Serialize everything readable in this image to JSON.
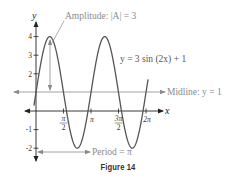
{
  "chart_data": {
    "type": "line",
    "title": "",
    "caption": "Figure 14",
    "function": "y = 3 sin (2x) + 1",
    "xlabel": "x",
    "ylabel": "y",
    "x_ticks": [
      {
        "value": 1.5708,
        "label_num": "π",
        "label_den": "2"
      },
      {
        "value": 3.1416,
        "label": "π"
      },
      {
        "value": 4.7124,
        "label_num": "3π",
        "label_den": "2"
      },
      {
        "value": 6.2832,
        "label": "2π"
      }
    ],
    "y_ticks": [
      {
        "value": 4,
        "label": "4"
      },
      {
        "value": 3,
        "label": "3"
      },
      {
        "value": 2,
        "label": "2"
      },
      {
        "value": -1,
        "label": "-1"
      },
      {
        "value": -2,
        "label": "-2"
      }
    ],
    "xlim": [
      -0.4,
      6.6
    ],
    "ylim": [
      -2.5,
      4.8
    ],
    "series": [
      {
        "name": "y = 3 sin (2x) + 1",
        "amplitude": 3,
        "frequency": 2,
        "vertical_shift": 1,
        "x_start": -0.12,
        "x_end": 6.4
      }
    ],
    "annotations": {
      "amplitude": "Amplitude: |A| = 3",
      "midline": "Midline: y = 1",
      "period": "Period = π",
      "equation": "y = 3 sin (2x) + 1"
    },
    "grid": false,
    "colors": {
      "curve": "#555555",
      "axis": "#222222",
      "annotation": "#8a8a8a"
    }
  }
}
